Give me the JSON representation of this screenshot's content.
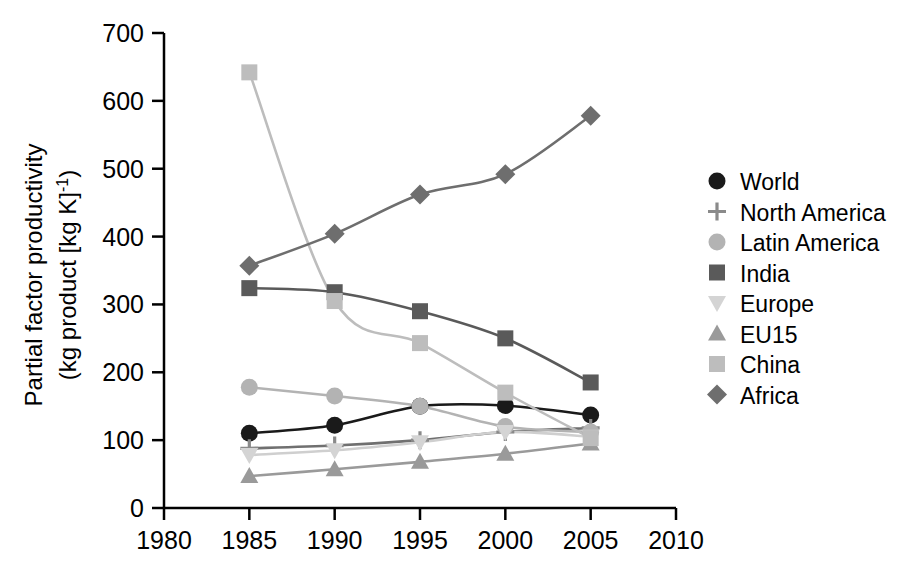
{
  "chart_data": {
    "type": "line",
    "title": "",
    "xlabel": "",
    "ylabel": "Partial factor productivity (kg product [kg K]-1)",
    "ylabel_line1": "Partial factor productivity",
    "ylabel_line2_main": "(kg product [kg K]",
    "ylabel_line2_sup": "-1",
    "ylabel_line2_tail": ")",
    "x": [
      1985,
      1990,
      1995,
      2000,
      2005
    ],
    "xlim": [
      1980,
      2010
    ],
    "ylim": [
      0,
      700
    ],
    "xticks": [
      "1980",
      "1985",
      "1990",
      "1995",
      "2000",
      "2005",
      "2010"
    ],
    "xtick_values": [
      1980,
      1985,
      1990,
      1995,
      2000,
      2005,
      2010
    ],
    "yticks": [
      "0",
      "100",
      "200",
      "300",
      "400",
      "500",
      "600",
      "700"
    ],
    "ytick_values": [
      0,
      100,
      200,
      300,
      400,
      500,
      600,
      700
    ],
    "grid": false,
    "legend_position": "right",
    "series": [
      {
        "name": "World",
        "marker": "circle",
        "color": "#1a1a1a",
        "line_color": "#1a1a1a",
        "values": [
          110,
          122,
          150,
          151,
          137
        ]
      },
      {
        "name": "North America",
        "marker": "plus",
        "color": "#8a8a8a",
        "line_color": "#707070",
        "values": [
          88,
          92,
          100,
          112,
          118
        ]
      },
      {
        "name": "Latin America",
        "marker": "circle",
        "color": "#b3b3b3",
        "line_color": "#b3b3b3",
        "values": [
          178,
          165,
          150,
          120,
          112
        ]
      },
      {
        "name": "India",
        "marker": "square",
        "color": "#5a5a5a",
        "line_color": "#5a5a5a",
        "values": [
          324,
          318,
          290,
          250,
          185
        ]
      },
      {
        "name": "Europe",
        "marker": "triangle-down",
        "color": "#d4d4d4",
        "line_color": "#cfcfcf",
        "values": [
          78,
          85,
          97,
          112,
          105
        ]
      },
      {
        "name": "EU15",
        "marker": "triangle-up",
        "color": "#9a9a9a",
        "line_color": "#9a9a9a",
        "values": [
          47,
          57,
          68,
          80,
          95
        ]
      },
      {
        "name": "China",
        "marker": "square",
        "color": "#bdbdbd",
        "line_color": "#bdbdbd",
        "values": [
          642,
          305,
          243,
          170,
          103
        ]
      },
      {
        "name": "Africa",
        "marker": "diamond",
        "color": "#6e6e6e",
        "line_color": "#6e6e6e",
        "values": [
          357,
          404,
          462,
          492,
          578
        ]
      }
    ]
  },
  "legend": {
    "entries": [
      {
        "label": "World"
      },
      {
        "label": "North America"
      },
      {
        "label": "Latin America"
      },
      {
        "label": "India"
      },
      {
        "label": "Europe"
      },
      {
        "label": "EU15"
      },
      {
        "label": "China"
      },
      {
        "label": "Africa"
      }
    ]
  },
  "colors": {
    "axis": "#000000",
    "background": "#ffffff"
  }
}
